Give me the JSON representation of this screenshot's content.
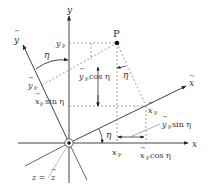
{
  "diagram": {
    "axes": {
      "x": "x",
      "y": "y",
      "x_tilde": "x",
      "y_tilde": "y",
      "z": "z = z"
    },
    "point": {
      "label": "P"
    },
    "labels": {
      "yP": "y",
      "yP_sub": "P",
      "xP": "x",
      "xP_sub": "P",
      "ytP": "y",
      "ytP_sub": "P",
      "xtP": "x",
      "xtP_sub": "P",
      "ytP_cos": "y",
      "ytP_cos_sub": "P",
      "ytP_cos_tail": "cos η",
      "xtP_sin": "x",
      "xtP_sin_sub": "P",
      "xtP_sin_tail": "sin η",
      "ytP_sin": "y",
      "ytP_sin_sub": "P",
      "ytP_sin_tail": "sin η",
      "xtP_cos": "x",
      "xtP_cos_sub": "P",
      "xtP_cos_tail": "cos η",
      "eta": "η",
      "z_eq": "z = ",
      "z_tilde": "z"
    }
  }
}
